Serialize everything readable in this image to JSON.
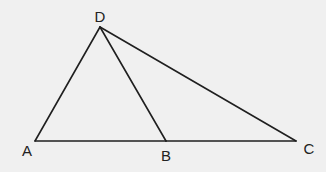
{
  "diagram": {
    "type": "geometry-triangle",
    "colors": {
      "background": "#f0f0f0",
      "line": "#1f1f1f",
      "label": "#222222"
    },
    "points": [
      {
        "name": "A",
        "x": 35,
        "y": 141,
        "label_x": 27,
        "label_y": 156
      },
      {
        "name": "B",
        "x": 166,
        "y": 141,
        "label_x": 166,
        "label_y": 161
      },
      {
        "name": "C",
        "x": 296,
        "y": 141,
        "label_x": 309,
        "label_y": 154
      },
      {
        "name": "D",
        "x": 100,
        "y": 27,
        "label_x": 100,
        "label_y": 22
      }
    ],
    "segments": [
      {
        "name": "AB",
        "from": "A",
        "to": "B"
      },
      {
        "name": "BC",
        "from": "B",
        "to": "C"
      },
      {
        "name": "AD",
        "from": "A",
        "to": "D"
      },
      {
        "name": "BD",
        "from": "B",
        "to": "D"
      },
      {
        "name": "CD",
        "from": "C",
        "to": "D"
      }
    ],
    "labels": {
      "A": "A",
      "B": "B",
      "C": "C",
      "D": "D"
    }
  }
}
